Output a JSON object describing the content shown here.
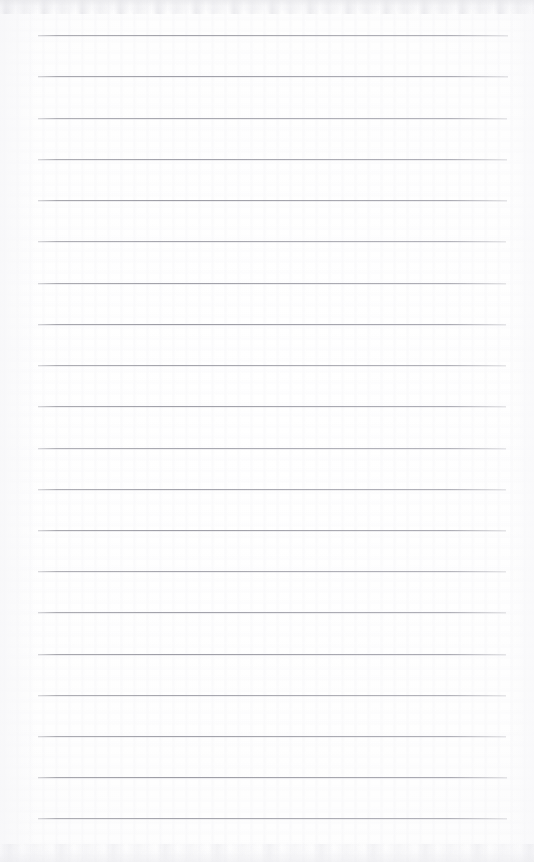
{
  "document": {
    "type": "scanned-lined-notepad-page",
    "title": "Blank Ruled Notepad Page",
    "content_text": "",
    "is_blank": true,
    "page_width": 534,
    "page_height": 862
  },
  "paper": {
    "background_color": "#fefefe",
    "tint_color": "#f7f7f8",
    "edge_smudge_color": "#e4e4e8"
  },
  "ruling": {
    "line_color": "#91919b",
    "line_count": 20,
    "line_thickness_px": 1,
    "line_spacing_px": 41.2,
    "first_line_y": 35,
    "last_line_y": 818,
    "line_start_x": 38,
    "line_end_x": 508,
    "lines": [
      {
        "index": 1,
        "y": 35,
        "x1": 38,
        "x2": 508
      },
      {
        "index": 2,
        "y": 76,
        "x1": 38,
        "x2": 508
      },
      {
        "index": 3,
        "y": 118,
        "x1": 38,
        "x2": 507
      },
      {
        "index": 4,
        "y": 159,
        "x1": 38,
        "x2": 507
      },
      {
        "index": 5,
        "y": 200,
        "x1": 38,
        "x2": 507
      },
      {
        "index": 6,
        "y": 241,
        "x1": 38,
        "x2": 506
      },
      {
        "index": 7,
        "y": 283,
        "x1": 38,
        "x2": 506
      },
      {
        "index": 8,
        "y": 324,
        "x1": 38,
        "x2": 506
      },
      {
        "index": 9,
        "y": 365,
        "x1": 38,
        "x2": 506
      },
      {
        "index": 10,
        "y": 406,
        "x1": 38,
        "x2": 506
      },
      {
        "index": 11,
        "y": 448,
        "x1": 38,
        "x2": 506
      },
      {
        "index": 12,
        "y": 489,
        "x1": 38,
        "x2": 506
      },
      {
        "index": 13,
        "y": 530,
        "x1": 38,
        "x2": 506
      },
      {
        "index": 14,
        "y": 571,
        "x1": 38,
        "x2": 506
      },
      {
        "index": 15,
        "y": 612,
        "x1": 38,
        "x2": 506
      },
      {
        "index": 16,
        "y": 654,
        "x1": 38,
        "x2": 506
      },
      {
        "index": 17,
        "y": 695,
        "x1": 38,
        "x2": 506
      },
      {
        "index": 18,
        "y": 736,
        "x1": 38,
        "x2": 506
      },
      {
        "index": 19,
        "y": 777,
        "x1": 38,
        "x2": 507
      },
      {
        "index": 20,
        "y": 818,
        "x1": 38,
        "x2": 507
      }
    ]
  },
  "margins": {
    "left_px": 38,
    "right_px": 26,
    "top_px": 35,
    "bottom_px": 44
  }
}
